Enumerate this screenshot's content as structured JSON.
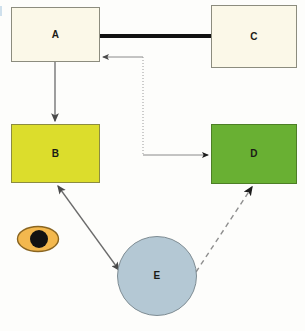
{
  "diagram": {
    "type": "flow-diagram",
    "canvas": {
      "width": 305,
      "height": 331,
      "background": "#fdfdfb"
    },
    "nodes": [
      {
        "id": "A",
        "label": "A",
        "shape": "rectangle",
        "x": 11,
        "y": 7,
        "width": 89,
        "height": 55,
        "fill": "#fbf8e8",
        "stroke": "#8c8c7e"
      },
      {
        "id": "C",
        "label": "C",
        "shape": "rectangle",
        "x": 211,
        "y": 5,
        "width": 86,
        "height": 63,
        "fill": "#fbf8e8",
        "stroke": "#8c8c7e"
      },
      {
        "id": "B",
        "label": "B",
        "shape": "rectangle",
        "x": 11,
        "y": 124,
        "width": 89,
        "height": 59,
        "fill": "#dcdd2c",
        "stroke": "#8c8c40"
      },
      {
        "id": "D",
        "label": "D",
        "shape": "rectangle",
        "x": 211,
        "y": 124,
        "width": 86,
        "height": 60,
        "fill": "#69b033",
        "stroke": "#4d7f26"
      },
      {
        "id": "E",
        "label": "E",
        "shape": "circle",
        "x": 117,
        "y": 236,
        "width": 80,
        "height": 80,
        "fill": "#b4c8d4",
        "stroke": "#7e8c93"
      }
    ],
    "eye_marker": {
      "name": "eye-marker",
      "x": 17,
      "y": 226,
      "width": 41,
      "height": 26,
      "iris_fill": "#f3b84e",
      "iris_stroke": "#8a6520",
      "pupil_fill": "#121212",
      "pupil_cx": 39,
      "pupil_cy": 239,
      "pupil_r": 9
    },
    "edges": [
      {
        "id": "A-C",
        "from": "A",
        "to": "C",
        "style": "thick-solid",
        "arrow": "none",
        "color": "#111111",
        "width": 4
      },
      {
        "id": "A-B",
        "from": "A",
        "to": "B",
        "style": "solid",
        "arrow": "end",
        "color": "#6b6b6b",
        "width": 1.3
      },
      {
        "id": "X-A",
        "from": "junction",
        "to": "A",
        "style": "solid",
        "arrow": "end",
        "color": "#8a8a8a",
        "width": 1
      },
      {
        "id": "X-D",
        "from": "junction",
        "to": "D",
        "style": "dotted-elbow",
        "arrow": "end",
        "color": "#9a9a9a",
        "width": 1
      },
      {
        "id": "E-B",
        "from": "E",
        "to": "B",
        "style": "solid",
        "arrow": "both",
        "color": "#6b6b6b",
        "width": 1.3
      },
      {
        "id": "E-D",
        "from": "E",
        "to": "D",
        "style": "dashed",
        "arrow": "end",
        "color": "#8e8e8e",
        "width": 1.4
      }
    ]
  }
}
